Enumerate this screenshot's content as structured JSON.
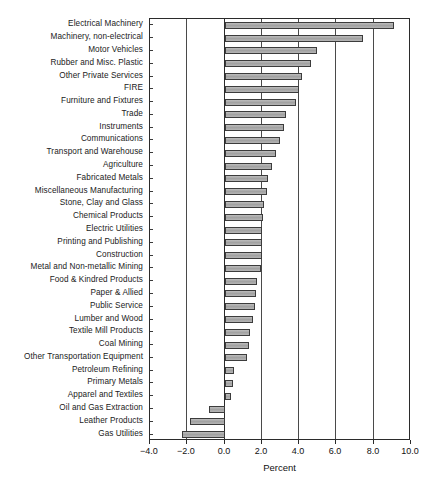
{
  "chart_data": {
    "type": "bar",
    "orientation": "horizontal",
    "title": "",
    "xlabel": "Percent",
    "ylabel": "",
    "xlim": [
      -4.0,
      10.0
    ],
    "xticks": [
      "-4.0",
      "-2.0",
      "0.0",
      "2.0",
      "4.0",
      "6.0",
      "8.0",
      "10.0"
    ],
    "xtick_values": [
      -4.0,
      -2.0,
      0.0,
      2.0,
      4.0,
      6.0,
      8.0,
      10.0
    ],
    "grid": "vertical",
    "legend": "none",
    "bar_fill_color": "#a8a8a8",
    "bar_edge_color": "#3c3c3c",
    "categories": [
      "Electrical Machinery",
      "Machinery, non-electrical",
      "Motor Vehicles",
      "Rubber and Misc. Plastic",
      "Other Private Services",
      "FIRE",
      "Furniture and Fixtures",
      "Trade",
      "Instruments",
      "Communications",
      "Transport and Warehouse",
      "Agriculture",
      "Fabricated Metals",
      "Miscellaneous Manufacturing",
      "Stone, Clay and Glass",
      "Chemical Products",
      "Electric Utilities",
      "Printing and Publishing",
      "Construction",
      "Metal and Non-metallic Mining",
      "Food & Kindred Products",
      "Paper & Allied",
      "Public Service",
      "Lumber and Wood",
      "Textile Mill Products",
      "Coal Mining",
      "Other Transportation Equipment",
      "Petroleum Refining",
      "Primary Metals",
      "Apparel and Textiles",
      "Oil and Gas Extraction",
      "Leather Products",
      "Gas Utilities"
    ],
    "values": [
      9.1,
      7.45,
      4.95,
      4.65,
      4.15,
      4.0,
      3.85,
      3.3,
      3.2,
      3.0,
      2.75,
      2.55,
      2.35,
      2.3,
      2.1,
      2.05,
      2.0,
      2.0,
      2.0,
      1.95,
      1.75,
      1.7,
      1.65,
      1.5,
      1.35,
      1.3,
      1.2,
      0.5,
      0.45,
      0.35,
      -0.85,
      -1.85,
      -2.3
    ]
  }
}
